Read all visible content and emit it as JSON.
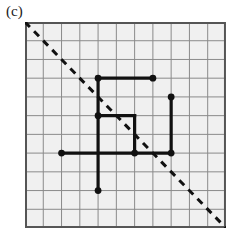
{
  "figure": {
    "panel_label": "(c)",
    "type": "lattice-grid-diagram",
    "background_color": "#ffffff"
  },
  "grid": {
    "columns": 11,
    "rows": 11,
    "cell_width": 18.27,
    "cell_height": 18.73,
    "origin_x": 0,
    "origin_y": 0,
    "line_color": "#8a8a8a",
    "border_color": "#555555",
    "fill_color": "#f0f0f0",
    "line_width": 1,
    "border_width": 2
  },
  "diagonal": {
    "name": "main-diagonal",
    "style": "dashed",
    "color": "#111111",
    "width": 3,
    "dash_pattern": "7 6",
    "from": [
      0,
      11
    ],
    "to": [
      11,
      0
    ]
  },
  "path": {
    "color": "#111111",
    "line_width": 3.2,
    "dot_radius": 3.4,
    "segments": [
      {
        "name": "top-horizontal-bar",
        "from": [
          4,
          8
        ],
        "to": [
          7,
          8
        ]
      },
      {
        "name": "left-vertical-spine",
        "from": [
          4,
          8
        ],
        "to": [
          4,
          2
        ]
      },
      {
        "name": "inner-horizontal-bar",
        "from": [
          4,
          6
        ],
        "to": [
          6,
          6
        ]
      },
      {
        "name": "inner-vertical-bar",
        "from": [
          6,
          6
        ],
        "to": [
          6,
          4
        ]
      },
      {
        "name": "bottom-horizontal-bar",
        "from": [
          2,
          4
        ],
        "to": [
          8,
          4
        ]
      },
      {
        "name": "right-vertical-bar",
        "from": [
          8,
          7
        ],
        "to": [
          8,
          4
        ]
      }
    ],
    "dots": [
      {
        "name": "dot-top-left",
        "at": [
          4,
          8
        ]
      },
      {
        "name": "dot-top-right",
        "at": [
          7,
          8
        ]
      },
      {
        "name": "dot-right-upper",
        "at": [
          8,
          7
        ]
      },
      {
        "name": "dot-inner-left",
        "at": [
          4,
          6
        ]
      },
      {
        "name": "dot-left-end",
        "at": [
          2,
          4
        ]
      },
      {
        "name": "dot-inner-bottom",
        "at": [
          6,
          4
        ]
      },
      {
        "name": "dot-right-lower",
        "at": [
          8,
          4
        ]
      },
      {
        "name": "dot-bottom-end",
        "at": [
          4,
          2
        ]
      }
    ]
  }
}
